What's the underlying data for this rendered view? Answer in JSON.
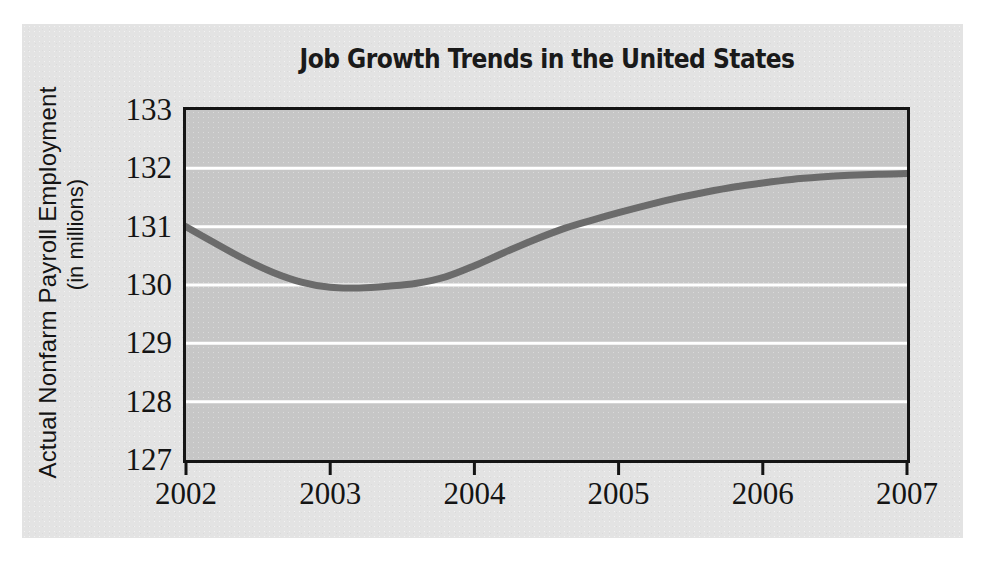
{
  "figure": {
    "background_color": "#e3e3e3",
    "plot_background_color": "#c6c6c6",
    "axis_color": "#141414",
    "gridline_color": "#ffffff",
    "series_color": "#6b6b6b"
  },
  "chart_data": {
    "type": "line",
    "title": "Job Growth Trends in the United States",
    "xlabel": "",
    "ylabel": "Actual Nonfarm Payroll Employment",
    "ylabel_line2": "(in millions)",
    "xlim": [
      2002,
      2007
    ],
    "ylim": [
      127,
      133
    ],
    "grid": true,
    "grid_axis": "y",
    "legend": false,
    "xticks": [
      "2002",
      "2003",
      "2004",
      "2005",
      "2006",
      "2007"
    ],
    "yticks": [
      "127",
      "128",
      "129",
      "130",
      "131",
      "132",
      "133"
    ],
    "series": [
      {
        "name": "Actual Nonfarm Payroll Employment",
        "color": "#6b6b6b",
        "x": [
          2002.0,
          2002.2,
          2002.4,
          2002.6,
          2002.8,
          2003.0,
          2003.2,
          2003.4,
          2003.6,
          2003.8,
          2004.0,
          2004.2,
          2004.4,
          2004.6,
          2004.8,
          2005.0,
          2005.2,
          2005.4,
          2005.6,
          2005.8,
          2006.0,
          2006.2,
          2006.4,
          2006.6,
          2006.8,
          2007.0
        ],
        "y": [
          131.0,
          130.72,
          130.45,
          130.22,
          130.05,
          129.96,
          129.95,
          129.98,
          130.03,
          130.14,
          130.33,
          130.55,
          130.76,
          130.95,
          131.1,
          131.24,
          131.37,
          131.49,
          131.59,
          131.68,
          131.75,
          131.81,
          131.85,
          131.88,
          131.9,
          131.91
        ]
      }
    ]
  }
}
